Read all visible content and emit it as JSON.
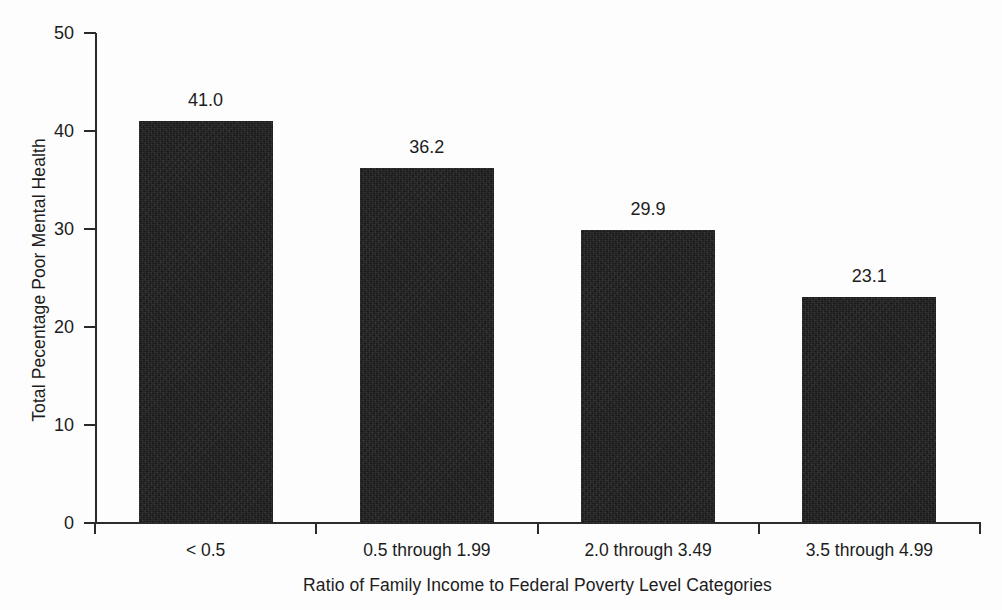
{
  "chart_data": {
    "type": "bar",
    "title": "",
    "xlabel": "Ratio of Family Income to Federal Poverty Level Categories",
    "ylabel": "Total Pecentage Poor Mental Health",
    "categories": [
      "< 0.5",
      "0.5 through 1.99",
      "2.0 through 3.49",
      "3.5 through 4.99"
    ],
    "values": [
      41.0,
      36.2,
      29.9,
      23.1
    ],
    "value_labels": [
      "41.0",
      "36.2",
      "29.9",
      "23.1"
    ],
    "ylim": [
      0,
      50
    ],
    "yticks": [
      0,
      10,
      20,
      30,
      40,
      50
    ],
    "ytick_labels": [
      "0",
      "10",
      "20",
      "30",
      "40",
      "50"
    ],
    "grid": false,
    "legend": null,
    "bar_color": "#191919",
    "background_color": "#ffffff",
    "axis_color": "#2b2b2b"
  }
}
